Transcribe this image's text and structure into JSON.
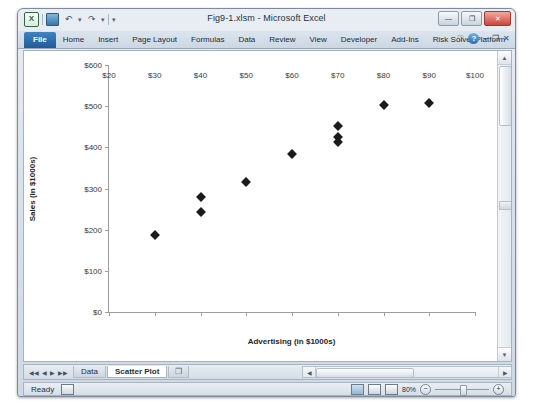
{
  "window": {
    "title": "Fig9-1.xlsm - Microsoft Excel",
    "quick_access": [
      {
        "name": "excel-logo",
        "glyph": "X"
      },
      {
        "name": "save-icon",
        "glyph": ""
      },
      {
        "name": "undo-icon",
        "glyph": "↶"
      },
      {
        "name": "undo-dropdown-icon",
        "glyph": "▾"
      },
      {
        "name": "redo-icon",
        "glyph": "↷"
      },
      {
        "name": "redo-dropdown-icon",
        "glyph": "▾"
      },
      {
        "name": "customize-qat-icon",
        "glyph": "▾"
      }
    ],
    "buttons": {
      "minimize": "—",
      "restore": "❐",
      "close": "✕"
    }
  },
  "ribbon": {
    "tabs": [
      "File",
      "Home",
      "Insert",
      "Page Layout",
      "Formulas",
      "Data",
      "Review",
      "View",
      "Developer",
      "Add-Ins",
      "Risk Solver Platform"
    ],
    "active_tab": "File",
    "right_icons": [
      {
        "name": "ribbon-options-icon",
        "glyph": "♡"
      },
      {
        "name": "help-icon",
        "glyph": "?"
      },
      {
        "name": "minimize-ribbon-icon",
        "glyph": "−"
      },
      {
        "name": "restore-window-icon",
        "glyph": "❐"
      },
      {
        "name": "close-workbook-icon",
        "glyph": "✕"
      }
    ]
  },
  "chart_data": {
    "type": "scatter",
    "title": "",
    "xlabel": "Advertising (in $1000s)",
    "ylabel": "Sales (in $1000s)",
    "xlim": [
      20,
      100
    ],
    "ylim": [
      0,
      600
    ],
    "xticks": [
      20,
      30,
      40,
      50,
      60,
      70,
      80,
      90,
      100
    ],
    "yticks": [
      0,
      100,
      200,
      300,
      400,
      500,
      600
    ],
    "xticklabels": [
      "$20",
      "$30",
      "$40",
      "$50",
      "$60",
      "$70",
      "$80",
      "$90",
      "$100"
    ],
    "yticklabels": [
      "$0",
      "$100",
      "$200",
      "$300",
      "$400",
      "$500",
      "$600"
    ],
    "grid": false,
    "legend": false,
    "marker": "diamond",
    "marker_color": "#1b1b1b",
    "series": [
      {
        "name": "Sales vs Advertising",
        "points": [
          {
            "x": 30,
            "y": 187
          },
          {
            "x": 40,
            "y": 280
          },
          {
            "x": 40,
            "y": 244
          },
          {
            "x": 50,
            "y": 315
          },
          {
            "x": 60,
            "y": 385
          },
          {
            "x": 70,
            "y": 453
          },
          {
            "x": 70,
            "y": 425
          },
          {
            "x": 70,
            "y": 413
          },
          {
            "x": 80,
            "y": 502
          },
          {
            "x": 90,
            "y": 507
          }
        ]
      }
    ]
  },
  "sheet_tabs": {
    "nav": [
      "◀◀",
      "◀",
      "▶",
      "▶▶"
    ],
    "tabs": [
      "Data",
      "Scatter Plot"
    ],
    "active": "Scatter Plot",
    "new_sheet_label": "❐"
  },
  "status_bar": {
    "mode": "Ready",
    "views": [
      "normal-view",
      "page-layout-view",
      "page-break-view"
    ],
    "active_view": "normal-view",
    "zoom": "80%",
    "zoom_out": "−",
    "zoom_in": "+"
  },
  "scrollbars": {
    "up_arrow": "▲",
    "down_arrow": "▼",
    "left_arrow": "◀",
    "right_arrow": "▶"
  }
}
